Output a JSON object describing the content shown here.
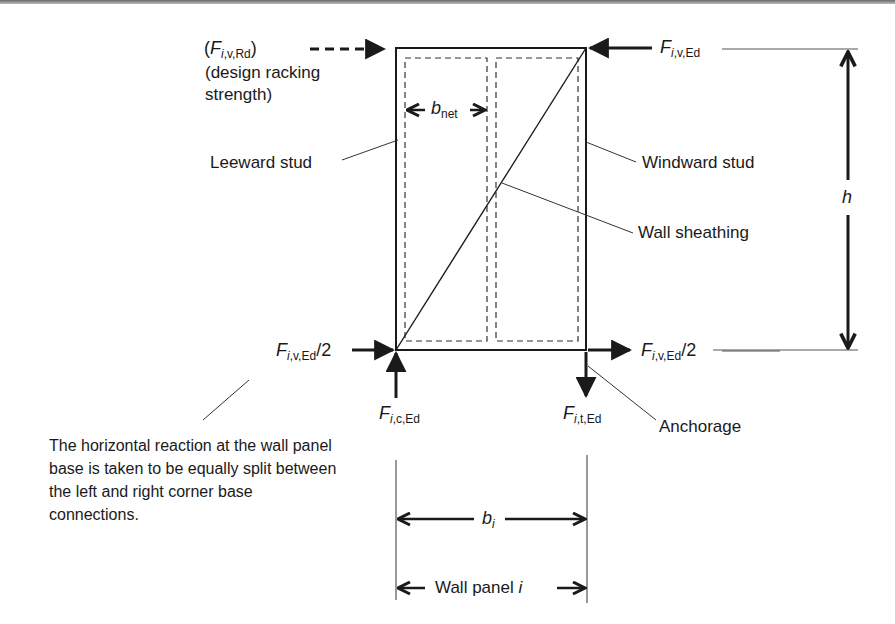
{
  "diagram": {
    "type": "structural force diagram",
    "colors": {
      "ink": "#1a1a1a",
      "background": "#ffffff",
      "leader": "#333333"
    }
  },
  "labels": {
    "design_racking_symbol": {
      "open": "(",
      "base": "F",
      "sub_italic": "i",
      "sub_rest": ",v,Rd",
      "close": ")"
    },
    "design_racking_text_1": "(design racking",
    "design_racking_text_2": "strength)",
    "applied_force": {
      "base": "F",
      "sub_italic": "i",
      "sub_rest": ",v,Ed"
    },
    "net_width": {
      "base": "b",
      "sub": "net"
    },
    "leeward_stud": "Leeward stud",
    "windward_stud": "Windward stud",
    "wall_sheathing": "Wall sheathing",
    "height": "h",
    "left_base_reaction": {
      "base": "F",
      "sub_italic": "i",
      "sub_rest": ",v,Ed",
      "suffix": "/2"
    },
    "right_base_reaction": {
      "base": "F",
      "sub_italic": "i",
      "sub_rest": ",v,Ed",
      "suffix": "/2"
    },
    "compression_reaction": {
      "base": "F",
      "sub_italic": "i",
      "sub_rest": ",c,Ed"
    },
    "tension_reaction": {
      "base": "F",
      "sub_italic": "i",
      "sub_rest": ",t,Ed"
    },
    "anchorage": "Anchorage",
    "panel_width": {
      "base": "b",
      "sub": "i"
    },
    "wall_panel": {
      "text": "Wall panel ",
      "italic": "i"
    },
    "note": "The horizontal reaction at the wall panel base is taken to be equally split between the left and right corner base connections."
  }
}
